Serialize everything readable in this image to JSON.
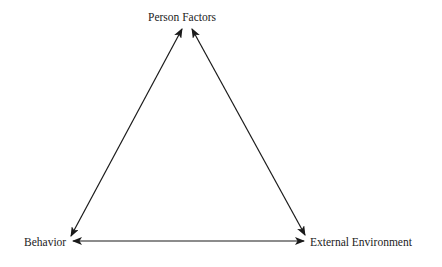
{
  "diagram": {
    "type": "triadic-reciprocal-triangle",
    "nodes": [
      {
        "id": "person",
        "label": "Person Factors"
      },
      {
        "id": "behavior",
        "label": "Behavior"
      },
      {
        "id": "environment",
        "label": "External Environment"
      }
    ],
    "edges": [
      {
        "from": "person",
        "to": "behavior",
        "direction": "bidirectional"
      },
      {
        "from": "person",
        "to": "environment",
        "direction": "bidirectional"
      },
      {
        "from": "behavior",
        "to": "environment",
        "direction": "bidirectional"
      }
    ],
    "colors": {
      "line": "#1a1a1a",
      "text": "#222222",
      "background": "#ffffff"
    }
  }
}
